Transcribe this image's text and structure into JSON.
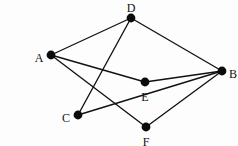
{
  "figure": {
    "background_color": "#fdfdfd",
    "line_color": "#111111",
    "node_color": "#0b0b0b",
    "width": 238,
    "height": 146
  },
  "chart_data": {
    "type": "diagram",
    "title": "",
    "nodes": [
      {
        "id": "A",
        "label": "A",
        "x": 51,
        "y": 55,
        "label_x": 39,
        "label_y": 59,
        "radius": 4.4
      },
      {
        "id": "D",
        "label": "D",
        "x": 131,
        "y": 18,
        "label_x": 131,
        "label_y": 9,
        "radius": 4.4
      },
      {
        "id": "B",
        "label": "B",
        "x": 222,
        "y": 71,
        "label_x": 233,
        "label_y": 75,
        "radius": 4.4
      },
      {
        "id": "E",
        "label": "E",
        "x": 145,
        "y": 82,
        "label_x": 145,
        "label_y": 98,
        "radius": 4.4
      },
      {
        "id": "C",
        "label": "C",
        "x": 78,
        "y": 115,
        "label_x": 66,
        "label_y": 119,
        "radius": 4.4
      },
      {
        "id": "F",
        "label": "F",
        "x": 146,
        "y": 127,
        "label_x": 146,
        "label_y": 143,
        "radius": 4.4
      }
    ],
    "edges": [
      {
        "id": "edge-a-d",
        "from": "A",
        "to": "D"
      },
      {
        "id": "edge-a-e",
        "from": "A",
        "to": "E"
      },
      {
        "id": "edge-a-f",
        "from": "A",
        "to": "F"
      },
      {
        "id": "edge-d-c",
        "from": "D",
        "to": "C"
      },
      {
        "id": "edge-d-b",
        "from": "D",
        "to": "B"
      },
      {
        "id": "edge-c-b",
        "from": "C",
        "to": "B"
      },
      {
        "id": "edge-e-b",
        "from": "E",
        "to": "B"
      },
      {
        "id": "edge-f-b",
        "from": "F",
        "to": "B"
      }
    ],
    "node_count": 6,
    "edge_count": 8,
    "directed": false,
    "grid": false,
    "legend": null,
    "xlabel": "",
    "ylabel": ""
  }
}
